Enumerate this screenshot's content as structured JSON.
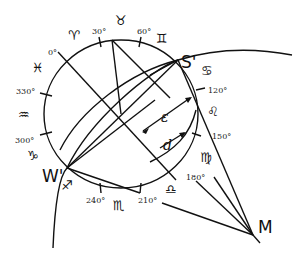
{
  "diagram": {
    "points": {
      "S_prime": "S'",
      "W_prime": "W'",
      "M": "M"
    },
    "angles": {
      "epsilon": "ε",
      "d": "d"
    },
    "degree_labels": {
      "d0": "0°",
      "d30": "30°",
      "d60": "60°",
      "d120": "120°",
      "d150": "150°",
      "d180": "180°",
      "d210": "210°",
      "d240": "240°",
      "d300": "300°",
      "d330": "330°"
    },
    "zodiac_signs": {
      "aries": "♈",
      "taurus": "♉",
      "gemini": "♊",
      "cancer": "♋",
      "leo": "♌",
      "virgo": "♍",
      "libra": "♎",
      "scorpio": "♏",
      "sagittarius": "♐",
      "capricorn": "♑",
      "aquarius": "♒",
      "pisces": "♓"
    }
  }
}
